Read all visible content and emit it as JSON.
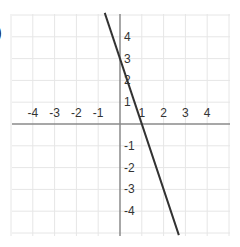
{
  "partial_label": ")",
  "chart_data": {
    "type": "line",
    "title": "",
    "xlabel": "",
    "ylabel": "",
    "xlim": [
      -5,
      5
    ],
    "ylim": [
      -5,
      5
    ],
    "grid": true,
    "x_ticks": [
      -4,
      -3,
      -2,
      -1,
      1,
      2,
      3,
      4
    ],
    "y_ticks": [
      4,
      3,
      2,
      1,
      -1,
      -2,
      -3,
      -4
    ],
    "x_tick_labels": [
      "-4",
      "-3",
      "-2",
      "-1",
      "1",
      "2",
      "3",
      "4"
    ],
    "y_tick_labels": [
      "4",
      "3",
      "2",
      "1",
      "-1",
      "-2",
      "-3",
      "-4"
    ],
    "series": [
      {
        "name": "line",
        "equation": "y = -3x + 3",
        "x": [
          -0.7,
          2.7
        ],
        "y": [
          5.1,
          -5.1
        ],
        "color": "#333333"
      }
    ]
  }
}
